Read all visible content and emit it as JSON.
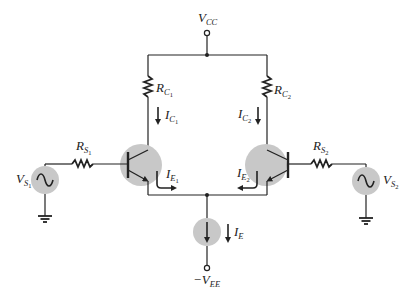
{
  "diagram": {
    "type": "circuit-schematic",
    "colors": {
      "wire": "#222222",
      "component_highlight": "#c8c8c8",
      "background": "#ffffff"
    },
    "supplies": {
      "vcc": {
        "main": "V",
        "sub": "CC"
      },
      "vee": {
        "main": "−V",
        "sub": "EE"
      }
    },
    "resistors": {
      "rc1": {
        "main": "R",
        "sub": "C",
        "subsub": "1"
      },
      "rc2": {
        "main": "R",
        "sub": "C",
        "subsub": "2"
      },
      "rs1": {
        "main": "R",
        "sub": "S",
        "subsub": "1"
      },
      "rs2": {
        "main": "R",
        "sub": "S",
        "subsub": "2"
      }
    },
    "currents": {
      "ic1": {
        "main": "I",
        "sub": "C",
        "subsub": "1"
      },
      "ic2": {
        "main": "I",
        "sub": "C",
        "subsub": "2"
      },
      "ie1": {
        "main": "I",
        "sub": "E",
        "subsub": "1"
      },
      "ie2": {
        "main": "I",
        "sub": "E",
        "subsub": "2"
      },
      "ie": {
        "main": "I",
        "sub": "E"
      }
    },
    "sources": {
      "vs1": {
        "main": "V",
        "sub": "S",
        "subsub": "1",
        "icon": "ac-sine-icon"
      },
      "vs2": {
        "main": "V",
        "sub": "S",
        "subsub": "2",
        "icon": "ac-sine-icon"
      }
    },
    "transistors": [
      {
        "id": "Q1",
        "type": "npn"
      },
      {
        "id": "Q2",
        "type": "npn"
      }
    ],
    "current_source": {
      "icon": "current-source-arrow-icon"
    },
    "grounds": 2
  }
}
